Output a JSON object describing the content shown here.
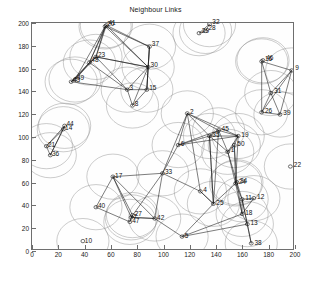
{
  "figure": {
    "title": "Neighbour Links",
    "background": "#ffffff",
    "axes_color": "#6e6e6e",
    "circle_color": "#8c8c8c",
    "link_color": "#101010",
    "label_color": "#111111"
  },
  "chart_data": {
    "type": "scatter",
    "title": "Neighbour Links",
    "xlabel": "",
    "ylabel": "",
    "xlim": [
      0,
      200
    ],
    "ylim": [
      0,
      200
    ],
    "xticks": [
      0,
      20,
      40,
      60,
      80,
      100,
      120,
      140,
      160,
      180,
      200
    ],
    "yticks": [
      0,
      20,
      40,
      60,
      80,
      100,
      120,
      140,
      160,
      180,
      200
    ],
    "grid": false,
    "legend": null,
    "marker": "circle-dot",
    "node_radius_units": 20,
    "nodes": [
      {
        "id": "1",
        "x": 150,
        "y": 86
      },
      {
        "id": "2",
        "x": 119,
        "y": 120
      },
      {
        "id": "3",
        "x": 73,
        "y": 141
      },
      {
        "id": "4",
        "x": 129,
        "y": 51
      },
      {
        "id": "5",
        "x": 115,
        "y": 11
      },
      {
        "id": "6",
        "x": 112,
        "y": 92
      },
      {
        "id": "7",
        "x": 76,
        "y": 28
      },
      {
        "id": "8",
        "x": 77,
        "y": 127
      },
      {
        "id": "9",
        "x": 199,
        "y": 158
      },
      {
        "id": "10",
        "x": 39,
        "y": 7
      },
      {
        "id": "11",
        "x": 161,
        "y": 44
      },
      {
        "id": "12",
        "x": 170,
        "y": 45
      },
      {
        "id": "13",
        "x": 165,
        "y": 22
      },
      {
        "id": "14",
        "x": 24,
        "y": 106
      },
      {
        "id": "15",
        "x": 88,
        "y": 141
      },
      {
        "id": "16",
        "x": 176,
        "y": 166
      },
      {
        "id": "17",
        "x": 62,
        "y": 64
      },
      {
        "id": "18",
        "x": 161,
        "y": 31
      },
      {
        "id": "19",
        "x": 158,
        "y": 100
      },
      {
        "id": "20",
        "x": 56,
        "y": 197
      },
      {
        "id": "21",
        "x": 11,
        "y": 91
      },
      {
        "id": "22",
        "x": 198,
        "y": 73
      },
      {
        "id": "23",
        "x": 49,
        "y": 170
      },
      {
        "id": "24",
        "x": 156,
        "y": 58
      },
      {
        "id": "25",
        "x": 139,
        "y": 40
      },
      {
        "id": "26",
        "x": 176,
        "y": 121
      },
      {
        "id": "27",
        "x": 77,
        "y": 30
      },
      {
        "id": "28",
        "x": 133,
        "y": 193
      },
      {
        "id": "29",
        "x": 128,
        "y": 191
      },
      {
        "id": "30",
        "x": 89,
        "y": 161
      },
      {
        "id": "31",
        "x": 183,
        "y": 138
      },
      {
        "id": "32",
        "x": 136,
        "y": 199
      },
      {
        "id": "33",
        "x": 100,
        "y": 67
      },
      {
        "id": "34",
        "x": 157,
        "y": 59
      },
      {
        "id": "35",
        "x": 136,
        "y": 100
      },
      {
        "id": "36",
        "x": 14,
        "y": 83
      },
      {
        "id": "37",
        "x": 90,
        "y": 179
      },
      {
        "id": "38",
        "x": 168,
        "y": 5
      },
      {
        "id": "39",
        "x": 190,
        "y": 119
      },
      {
        "id": "40",
        "x": 49,
        "y": 37
      },
      {
        "id": "41",
        "x": 57,
        "y": 198
      },
      {
        "id": "42",
        "x": 94,
        "y": 27
      },
      {
        "id": "43",
        "x": 30,
        "y": 148
      },
      {
        "id": "44",
        "x": 25,
        "y": 109
      },
      {
        "id": "45",
        "x": 143,
        "y": 105
      },
      {
        "id": "46",
        "x": 177,
        "y": 167
      },
      {
        "id": "47",
        "x": 75,
        "y": 24
      },
      {
        "id": "48",
        "x": 44,
        "y": 165
      },
      {
        "id": "49",
        "x": 33,
        "y": 150
      },
      {
        "id": "50",
        "x": 155,
        "y": 92
      }
    ],
    "links": [
      [
        "20",
        "23"
      ],
      [
        "20",
        "30"
      ],
      [
        "20",
        "37"
      ],
      [
        "20",
        "48"
      ],
      [
        "20",
        "41"
      ],
      [
        "20",
        "49"
      ],
      [
        "41",
        "23"
      ],
      [
        "41",
        "30"
      ],
      [
        "41",
        "37"
      ],
      [
        "41",
        "48"
      ],
      [
        "23",
        "48"
      ],
      [
        "23",
        "49"
      ],
      [
        "23",
        "43"
      ],
      [
        "23",
        "30"
      ],
      [
        "23",
        "3"
      ],
      [
        "48",
        "49"
      ],
      [
        "48",
        "43"
      ],
      [
        "48",
        "3"
      ],
      [
        "49",
        "43"
      ],
      [
        "30",
        "37"
      ],
      [
        "30",
        "15"
      ],
      [
        "30",
        "3"
      ],
      [
        "30",
        "8"
      ],
      [
        "30",
        "23"
      ],
      [
        "37",
        "30"
      ],
      [
        "37",
        "15"
      ],
      [
        "3",
        "15"
      ],
      [
        "3",
        "8"
      ],
      [
        "3",
        "43"
      ],
      [
        "15",
        "8"
      ],
      [
        "15",
        "30"
      ],
      [
        "29",
        "28"
      ],
      [
        "28",
        "32"
      ],
      [
        "29",
        "32"
      ],
      [
        "16",
        "46"
      ],
      [
        "16",
        "9"
      ],
      [
        "16",
        "31"
      ],
      [
        "16",
        "26"
      ],
      [
        "9",
        "31"
      ],
      [
        "9",
        "26"
      ],
      [
        "9",
        "39"
      ],
      [
        "31",
        "26"
      ],
      [
        "31",
        "39"
      ],
      [
        "26",
        "39"
      ],
      [
        "14",
        "44"
      ],
      [
        "14",
        "21"
      ],
      [
        "14",
        "36"
      ],
      [
        "21",
        "36"
      ],
      [
        "44",
        "21"
      ],
      [
        "44",
        "36"
      ],
      [
        "2",
        "6"
      ],
      [
        "2",
        "35"
      ],
      [
        "2",
        "45"
      ],
      [
        "2",
        "19"
      ],
      [
        "2",
        "33"
      ],
      [
        "6",
        "35"
      ],
      [
        "6",
        "45"
      ],
      [
        "6",
        "33"
      ],
      [
        "6",
        "19"
      ],
      [
        "35",
        "45"
      ],
      [
        "35",
        "19"
      ],
      [
        "35",
        "1"
      ],
      [
        "45",
        "19"
      ],
      [
        "45",
        "1"
      ],
      [
        "19",
        "1"
      ],
      [
        "19",
        "50"
      ],
      [
        "1",
        "50"
      ],
      [
        "1",
        "24"
      ],
      [
        "1",
        "34"
      ],
      [
        "50",
        "24"
      ],
      [
        "50",
        "34"
      ],
      [
        "24",
        "34"
      ],
      [
        "24",
        "11"
      ],
      [
        "34",
        "11"
      ],
      [
        "11",
        "12"
      ],
      [
        "11",
        "18"
      ],
      [
        "11",
        "13"
      ],
      [
        "12",
        "18"
      ],
      [
        "18",
        "13"
      ],
      [
        "13",
        "38"
      ],
      [
        "11",
        "38"
      ],
      [
        "25",
        "24"
      ],
      [
        "25",
        "35"
      ],
      [
        "25",
        "4"
      ],
      [
        "4",
        "25"
      ],
      [
        "4",
        "33"
      ],
      [
        "4",
        "2"
      ],
      [
        "33",
        "17"
      ],
      [
        "33",
        "42"
      ],
      [
        "33",
        "7"
      ],
      [
        "17",
        "40"
      ],
      [
        "17",
        "7"
      ],
      [
        "17",
        "27"
      ],
      [
        "17",
        "42"
      ],
      [
        "7",
        "27"
      ],
      [
        "7",
        "47"
      ],
      [
        "7",
        "42"
      ],
      [
        "27",
        "47"
      ],
      [
        "47",
        "40"
      ],
      [
        "42",
        "5"
      ],
      [
        "42",
        "7"
      ],
      [
        "5",
        "13"
      ],
      [
        "5",
        "25"
      ],
      [
        "5",
        "18"
      ],
      [
        "35",
        "25"
      ],
      [
        "45",
        "25"
      ],
      [
        "19",
        "24"
      ],
      [
        "24",
        "18"
      ],
      [
        "34",
        "18"
      ]
    ]
  }
}
